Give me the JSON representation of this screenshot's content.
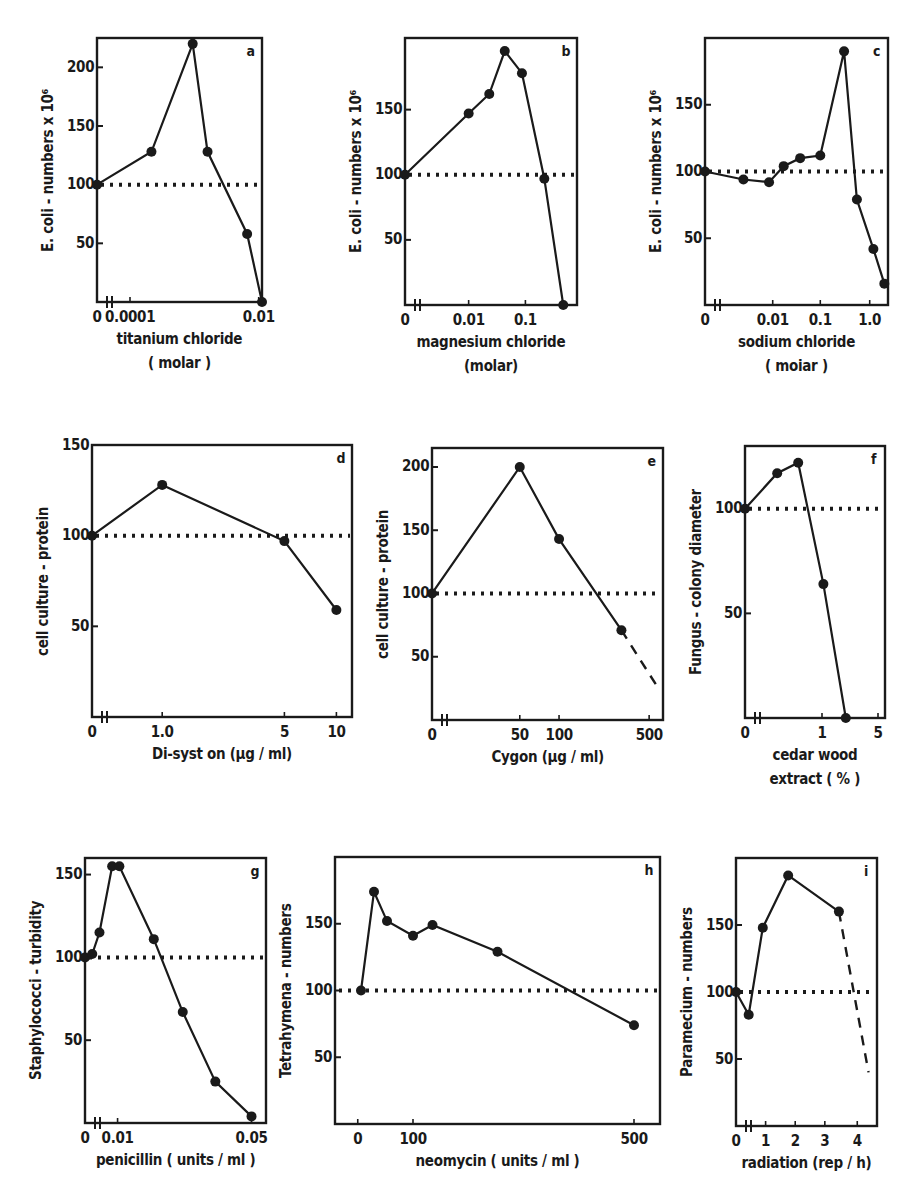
{
  "figure": {
    "reference_line_value": 100,
    "colors": {
      "ink": "#1a1a1a",
      "background": "#ffffff"
    }
  },
  "chart_data": [
    {
      "id": "a",
      "panel_label": "a",
      "type": "line",
      "ylabel": "E. coli - numbers x 10⁶",
      "xlabel": "titanium chloride",
      "xlabel2": "( molar )",
      "yticks": [
        50,
        100,
        150,
        200
      ],
      "xtick_labels": [
        {
          "label": "0",
          "pos": 0
        },
        {
          "label": "0.0001",
          "pos": 0.2
        },
        {
          "label": "0.01",
          "pos": 0.98
        }
      ],
      "ylim": [
        0,
        225
      ],
      "reference_line": 100,
      "points": [
        {
          "x": 0,
          "y": 100
        },
        {
          "x": 0.33,
          "y": 128
        },
        {
          "x": 0.58,
          "y": 220
        },
        {
          "x": 0.67,
          "y": 128
        },
        {
          "x": 0.91,
          "y": 58
        },
        {
          "x": 1.0,
          "y": 0
        }
      ],
      "dashed_extension": []
    },
    {
      "id": "b",
      "panel_label": "b",
      "type": "line",
      "ylabel": "E. coli - numbers x 10⁶",
      "xlabel": "magnesium chloride",
      "xlabel2": "(molar)",
      "yticks": [
        50,
        100,
        150
      ],
      "xtick_labels": [
        {
          "label": "0",
          "pos": 0
        },
        {
          "label": "0.01",
          "pos": 0.37
        },
        {
          "label": "0.1",
          "pos": 0.7
        }
      ],
      "ylim": [
        0,
        205
      ],
      "reference_line": 100,
      "points": [
        {
          "x": 0,
          "y": 100
        },
        {
          "x": 0.37,
          "y": 147
        },
        {
          "x": 0.49,
          "y": 162
        },
        {
          "x": 0.58,
          "y": 195
        },
        {
          "x": 0.68,
          "y": 178
        },
        {
          "x": 0.81,
          "y": 97
        },
        {
          "x": 0.92,
          "y": 0
        }
      ],
      "dashed_extension": []
    },
    {
      "id": "c",
      "panel_label": "c",
      "type": "line",
      "ylabel": "E. coli - numbers x 10⁶",
      "xlabel": "sodium chloride",
      "xlabel2": "( moiar )",
      "yticks": [
        50,
        100,
        150
      ],
      "xtick_labels": [
        {
          "label": "0",
          "pos": 0
        },
        {
          "label": "0.01",
          "pos": 0.37
        },
        {
          "label": "0.1",
          "pos": 0.63
        },
        {
          "label": "1.0",
          "pos": 0.9
        }
      ],
      "ylim": [
        0,
        200
      ],
      "reference_line": 100,
      "points": [
        {
          "x": 0,
          "y": 100
        },
        {
          "x": 0.21,
          "y": 94
        },
        {
          "x": 0.35,
          "y": 92
        },
        {
          "x": 0.43,
          "y": 104
        },
        {
          "x": 0.52,
          "y": 110
        },
        {
          "x": 0.63,
          "y": 112
        },
        {
          "x": 0.76,
          "y": 190
        },
        {
          "x": 0.83,
          "y": 79
        },
        {
          "x": 0.92,
          "y": 42
        },
        {
          "x": 0.98,
          "y": 16
        }
      ],
      "dashed_extension": []
    },
    {
      "id": "d",
      "panel_label": "d",
      "type": "line",
      "ylabel": "cell culture - protein",
      "xlabel": "Di-syst on (μg / ml)",
      "xlabel2": "",
      "yticks": [
        50,
        100,
        150
      ],
      "xtick_labels": [
        {
          "label": "0",
          "pos": 0
        },
        {
          "label": "1.0",
          "pos": 0.27
        },
        {
          "label": "5",
          "pos": 0.74
        },
        {
          "label": "10",
          "pos": 0.94
        }
      ],
      "ylim": [
        0,
        150
      ],
      "reference_line": 100,
      "points": [
        {
          "x": 0,
          "y": 100
        },
        {
          "x": 0.27,
          "y": 128
        },
        {
          "x": 0.74,
          "y": 97
        },
        {
          "x": 0.94,
          "y": 59
        }
      ],
      "dashed_extension": []
    },
    {
      "id": "e",
      "panel_label": "e",
      "type": "line",
      "ylabel": "cell culture - protein",
      "xlabel": "Cygon (μg / ml)",
      "xlabel2": "",
      "yticks": [
        50,
        100,
        150,
        200
      ],
      "xtick_labels": [
        {
          "label": "0",
          "pos": 0
        },
        {
          "label": "50",
          "pos": 0.38
        },
        {
          "label": "100",
          "pos": 0.55
        },
        {
          "label": "500",
          "pos": 0.94
        }
      ],
      "ylim": [
        0,
        215
      ],
      "reference_line": 100,
      "points": [
        {
          "x": 0,
          "y": 100
        },
        {
          "x": 0.38,
          "y": 200
        },
        {
          "x": 0.55,
          "y": 143
        },
        {
          "x": 0.82,
          "y": 71
        }
      ],
      "dashed_extension": [
        {
          "x": 0.82,
          "y": 71
        },
        {
          "x": 0.98,
          "y": 25
        }
      ]
    },
    {
      "id": "f",
      "panel_label": "f",
      "type": "line",
      "ylabel": "Fungus - colony diameter",
      "xlabel": "cedar wood",
      "xlabel2": "extract ( % )",
      "yticks": [
        50,
        100
      ],
      "xtick_labels": [
        {
          "label": "0",
          "pos": 0
        },
        {
          "label": "1",
          "pos": 0.55
        },
        {
          "label": "5",
          "pos": 0.95
        }
      ],
      "ylim": [
        0,
        130
      ],
      "reference_line": 100,
      "points": [
        {
          "x": 0,
          "y": 100
        },
        {
          "x": 0.23,
          "y": 117
        },
        {
          "x": 0.38,
          "y": 122
        },
        {
          "x": 0.56,
          "y": 64
        },
        {
          "x": 0.72,
          "y": 0
        }
      ],
      "dashed_extension": []
    },
    {
      "id": "g",
      "panel_label": "g",
      "type": "line",
      "ylabel": "Staphylococci - turbidity",
      "xlabel": "penicillin ( units / ml )",
      "xlabel2": "",
      "yticks": [
        50,
        100,
        150
      ],
      "xtick_labels": [
        {
          "label": "0",
          "pos": 0
        },
        {
          "label": "0.01",
          "pos": 0.18
        },
        {
          "label": "0.05",
          "pos": 0.92
        }
      ],
      "ylim": [
        0,
        160
      ],
      "reference_line": 100,
      "points": [
        {
          "x": 0,
          "y": 100
        },
        {
          "x": 0.04,
          "y": 102
        },
        {
          "x": 0.08,
          "y": 115
        },
        {
          "x": 0.15,
          "y": 155
        },
        {
          "x": 0.19,
          "y": 155
        },
        {
          "x": 0.38,
          "y": 111
        },
        {
          "x": 0.54,
          "y": 67
        },
        {
          "x": 0.72,
          "y": 25
        },
        {
          "x": 0.92,
          "y": 4
        }
      ],
      "dashed_extension": []
    },
    {
      "id": "h",
      "panel_label": "h",
      "type": "line",
      "ylabel": "Tetrahymena - numbers",
      "xlabel": "neomycin ( units / ml )",
      "xlabel2": "",
      "yticks": [
        50,
        100,
        150
      ],
      "xtick_labels": [
        {
          "label": "0",
          "pos": 0.07
        },
        {
          "label": "100",
          "pos": 0.24
        },
        {
          "label": "500",
          "pos": 0.92
        }
      ],
      "ylim": [
        0,
        200
      ],
      "reference_line": 100,
      "points": [
        {
          "x": 0.08,
          "y": 100
        },
        {
          "x": 0.12,
          "y": 174
        },
        {
          "x": 0.16,
          "y": 152
        },
        {
          "x": 0.24,
          "y": 141
        },
        {
          "x": 0.3,
          "y": 149
        },
        {
          "x": 0.5,
          "y": 129
        },
        {
          "x": 0.92,
          "y": 74
        }
      ],
      "dashed_extension": []
    },
    {
      "id": "i",
      "panel_label": "i",
      "type": "line",
      "ylabel": "Paramecium - numbers",
      "xlabel": "radiation (rep / h)",
      "xlabel2": "",
      "yticks": [
        50,
        100,
        150
      ],
      "xtick_labels": [
        {
          "label": "0",
          "pos": 0
        },
        {
          "label": "1",
          "pos": 0.21
        },
        {
          "label": "2",
          "pos": 0.42
        },
        {
          "label": "3",
          "pos": 0.63
        },
        {
          "label": "4",
          "pos": 0.86
        }
      ],
      "ylim": [
        0,
        200
      ],
      "reference_line": 100,
      "points": [
        {
          "x": 0,
          "y": 100
        },
        {
          "x": 0.09,
          "y": 83
        },
        {
          "x": 0.19,
          "y": 148
        },
        {
          "x": 0.37,
          "y": 187
        },
        {
          "x": 0.73,
          "y": 160
        }
      ],
      "dashed_extension": [
        {
          "x": 0.73,
          "y": 160
        },
        {
          "x": 0.94,
          "y": 40
        }
      ]
    }
  ]
}
